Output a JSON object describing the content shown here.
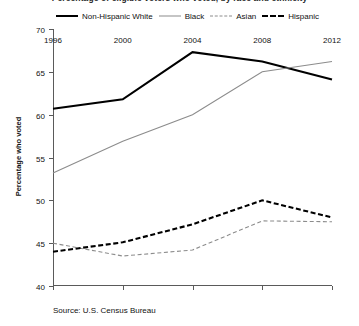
{
  "figure": {
    "title_clipped": "Percentage of eligible voters who voted, by race and ethnicity",
    "source_note": "Source: U.S. Census Bureau"
  },
  "legend": {
    "position": "top",
    "items": [
      {
        "label": "Non-Hispanic White",
        "style": "solid",
        "color": "#000000",
        "width": "thick"
      },
      {
        "label": "Black",
        "style": "solid",
        "color": "#8c8c8c",
        "width": "thin"
      },
      {
        "label": "Asian",
        "style": "dashed",
        "color": "#8c8c8c",
        "width": "thin"
      },
      {
        "label": "Hispanic",
        "style": "dashed",
        "color": "#000000",
        "width": "thick"
      }
    ]
  },
  "axes": {
    "ylabel": "Percentage who voted",
    "xlabel": "",
    "yticks": [
      "70",
      "65",
      "60",
      "55",
      "50",
      "45",
      "40"
    ],
    "xticks": [
      "1996",
      "2000",
      "2004",
      "2008",
      "2012"
    ]
  },
  "chart_data": {
    "type": "line",
    "title": "Percentage of eligible voters who voted, by race and ethnicity",
    "xlabel": "",
    "ylabel": "Percentage who voted",
    "x": [
      1996,
      2000,
      2004,
      2008,
      2012
    ],
    "categories": [
      "1996",
      "2000",
      "2004",
      "2008",
      "2012"
    ],
    "ylim": [
      40,
      70
    ],
    "ytick_step": 5,
    "grid": false,
    "legend_position": "top",
    "series": [
      {
        "name": "Non-Hispanic White",
        "color": "#000000",
        "linestyle": "solid",
        "linewidth": "thick",
        "values": [
          60.7,
          61.8,
          67.3,
          66.2,
          64.1
        ]
      },
      {
        "name": "Black",
        "color": "#8c8c8c",
        "linestyle": "solid",
        "linewidth": "thin",
        "values": [
          53.2,
          56.9,
          60.0,
          65.0,
          66.2
        ]
      },
      {
        "name": "Asian",
        "color": "#8c8c8c",
        "linestyle": "dashed",
        "linewidth": "thin",
        "values": [
          45.0,
          43.5,
          44.2,
          47.6,
          47.5
        ]
      },
      {
        "name": "Hispanic",
        "color": "#000000",
        "linestyle": "dashed",
        "linewidth": "thick",
        "values": [
          44.0,
          45.1,
          47.2,
          50.0,
          48.0
        ]
      }
    ],
    "annotations": [
      "Source: U.S. Census Bureau"
    ]
  }
}
